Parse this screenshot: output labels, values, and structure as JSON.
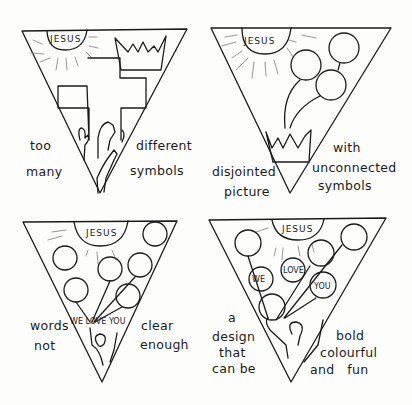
{
  "panels": [
    {
      "id": "top-left",
      "sun_label": "JESUS",
      "symbols": [
        "sun",
        "crown",
        "cross",
        "hands"
      ],
      "caption_left": [
        "too",
        "many"
      ],
      "caption_right": [
        "different",
        "symbols"
      ]
    },
    {
      "id": "top-right",
      "sun_label": "JESUS",
      "symbols": [
        "sun",
        "balloons",
        "crown"
      ],
      "caption_left": [
        "disjointed",
        "picture"
      ],
      "caption_right": [
        "with",
        "unconnected",
        "symbols"
      ]
    },
    {
      "id": "bottom-left",
      "sun_label": "JESUS",
      "symbols": [
        "sun",
        "balloons",
        "figure"
      ],
      "inline_text": "WE LOVE YOU",
      "caption_left": [
        "words",
        "not"
      ],
      "caption_right": [
        "clear",
        "enough"
      ]
    },
    {
      "id": "bottom-right",
      "sun_label": "JESUS",
      "symbols": [
        "sun",
        "balloons",
        "figure"
      ],
      "balloon_words": [
        "WE",
        "LOVE",
        "YOU"
      ],
      "caption_left": [
        "a",
        "design",
        "that",
        "can be"
      ],
      "caption_right": [
        "bold",
        "colourful",
        "and   fun"
      ]
    }
  ]
}
